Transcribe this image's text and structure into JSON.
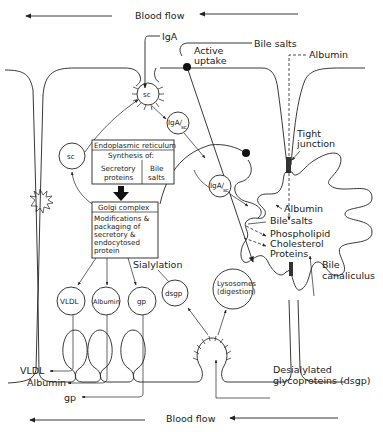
{
  "diagram": {
    "blood_flow_top": "Blood flow",
    "blood_flow_bottom": "Blood flow",
    "labels": {
      "iga": "IgA",
      "bile_salts_top": "Bile salts",
      "active_uptake_1": "Active",
      "active_uptake_2": "uptake",
      "albumin_top": "Albumin",
      "tight_junction_1": "Tight",
      "tight_junction_2": "junction",
      "albumin_canal": "Albumin",
      "bile_salts_canal": "Bile salts",
      "phospholipid": "Phospholipid",
      "cholesterol": "Cholesterol",
      "proteins": "Proteins",
      "bile_canaliculus_1": "Bile",
      "bile_canaliculus_2": "canaliculus",
      "sialylation": "Sialylation",
      "vldl_out": "VLDL",
      "albumin_out": "Albumin",
      "gp_out": "gp",
      "dsgp_desc_1": "Desialylated",
      "dsgp_desc_2": "glycoproteins (dsgp)"
    },
    "vesicles": {
      "sc_top": "sc",
      "sc_left": "sc",
      "iga_sc_1_main": "IgA/",
      "iga_sc_1_sub": "sc",
      "iga_sc_2_main": "IgA/",
      "iga_sc_2_sub": "sc",
      "vldl": "VLDL",
      "albumin": "Albumin",
      "gp": "gp",
      "dsgp": "dsgp",
      "lysosomes_1": "Lysosomes",
      "lysosomes_2": "(digestion)"
    },
    "er_box": {
      "title": "Endoplasmic reticulum",
      "subtitle": "Synthesis of:",
      "col1_1": "Secretory",
      "col1_2": "proteins",
      "col2_1": "Bile",
      "col2_2": "salts"
    },
    "golgi_box": {
      "title": "Golgi complex",
      "line1": "Modifications &",
      "line2": "packaging of",
      "line3": "secretory &",
      "line4": "endocytosed",
      "line5": "protein"
    }
  }
}
